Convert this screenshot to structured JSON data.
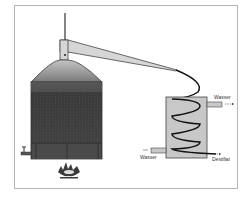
{
  "diagram": {
    "type": "distillation apparatus (pot still with coil condenser)",
    "labels": {
      "water_out": "Wasser",
      "water_in": "Wasser",
      "distillate": "Destillat"
    },
    "components": [
      "thermometer",
      "still-head",
      "lyne-arm",
      "boiler-dome",
      "boiler",
      "drain-tap",
      "burner-flame",
      "vapor-pipe",
      "condenser",
      "cooling-coil",
      "water-inlet",
      "water-outlet",
      "distillate-outlet"
    ],
    "colors": {
      "boiler_dark": "#3c3c3c",
      "dome_light": "#b0b0b0",
      "dome_dark": "#7a7a7a",
      "condenser": "#c8c8c8",
      "coil": "#111111",
      "frame": "#b4b4b4"
    }
  }
}
